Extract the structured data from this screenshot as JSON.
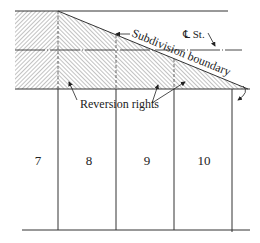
{
  "diagram": {
    "labels": {
      "centerline": "℄ St.",
      "subdivision_boundary": "Subdivision boundary",
      "reversion_rights": "Reversion rights"
    },
    "lots": [
      {
        "number": "7"
      },
      {
        "number": "8"
      },
      {
        "number": "9"
      },
      {
        "number": "10"
      }
    ],
    "colors": {
      "line": "#333333",
      "hatch": "#555555",
      "background": "#ffffff"
    }
  }
}
